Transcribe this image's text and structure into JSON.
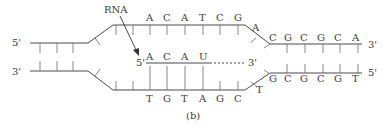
{
  "diagram": {
    "panel_label": "(b)",
    "rna_label": "RNA",
    "left": {
      "top_end": "5'",
      "bottom_end": "3'"
    },
    "right": {
      "top_end": "3'",
      "bottom_end": "5'"
    },
    "template_top_bases": [
      "A",
      "C",
      "A",
      "T",
      "C",
      "G"
    ],
    "top_fork_base": "A",
    "right_top_bases": [
      "C",
      "G",
      "C",
      "G",
      "C",
      "A"
    ],
    "bottom_bases": [
      "T",
      "G",
      "T",
      "A",
      "G",
      "C"
    ],
    "bottom_fork_base": "T",
    "right_bottom_bases": [
      "G",
      "C",
      "G",
      "C",
      "G",
      "T"
    ],
    "rna": {
      "five_prime": "5'",
      "three_prime": "3'",
      "bases": [
        "A",
        "C",
        "A",
        "U"
      ]
    }
  }
}
